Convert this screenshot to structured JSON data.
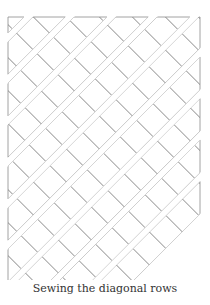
{
  "caption": "Sewing the diagonal rows",
  "diagram": {
    "row_count": 8,
    "line_color": "#8c8c8c",
    "fill_color": "#ffffff",
    "square_diagonal_px": 33,
    "row_gap_px": 6,
    "frame": {
      "left": 8,
      "top": 17,
      "right": 200,
      "bottom": 285
    }
  }
}
